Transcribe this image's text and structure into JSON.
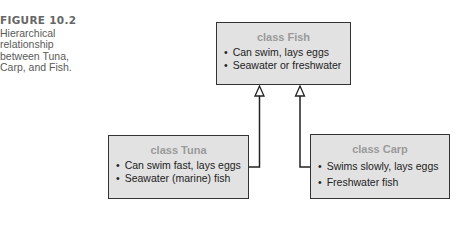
{
  "caption": {
    "figure_number": "FIGURE 10.2",
    "text": "Hierarchical relationship between Tuna, Carp, and Fish."
  },
  "diagram": {
    "type": "class-hierarchy",
    "classes": {
      "fish": {
        "title": "class Fish",
        "attributes": [
          "Can swim, lays eggs",
          "Seawater or freshwater"
        ]
      },
      "tuna": {
        "title": "class Tuna",
        "attributes": [
          "Can swim fast, lays eggs",
          "Seawater (marine) fish"
        ]
      },
      "carp": {
        "title": "class Carp",
        "attributes": [
          "Swims slowly, lays eggs",
          "Freshwater fish"
        ]
      }
    },
    "relationships": [
      {
        "from": "class Tuna",
        "to": "class Fish",
        "kind": "inherits"
      },
      {
        "from": "class Carp",
        "to": "class Fish",
        "kind": "inherits"
      }
    ],
    "colors": {
      "box_fill": "#e2e2e2",
      "box_border": "#333333",
      "title_text": "#9a9a9a",
      "caption_text": "#5a5a5a"
    }
  }
}
